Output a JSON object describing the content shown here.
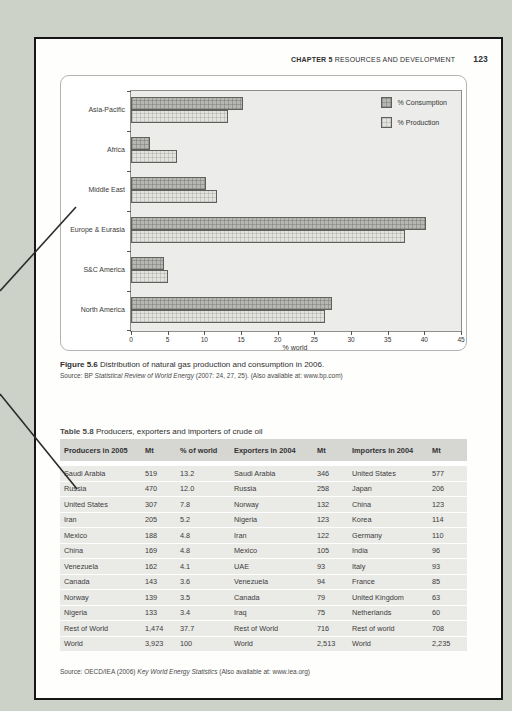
{
  "header": {
    "chapter_label": "CHAPTER 5",
    "chapter_title": "RESOURCES AND DEVELOPMENT",
    "page_number": "123"
  },
  "figure": {
    "caption_label": "Figure 5.6",
    "caption_text": " Distribution of natural gas production and consumption in 2006.",
    "source_prefix": "Source: BP ",
    "source_italic": "Statistical Review of World Energy",
    "source_suffix": " (2007: 24, 27, 25). (Also available at: www.bp.com)"
  },
  "chart_data": {
    "type": "bar",
    "orientation": "horizontal",
    "categories": [
      "Asia-Pacific",
      "Africa",
      "Middle East",
      "Europe & Eurasia",
      "S&C America",
      "North America"
    ],
    "series": [
      {
        "name": "% Consumption",
        "values": [
          15.3,
          2.6,
          10.2,
          40.2,
          4.5,
          27.4
        ],
        "color": "#b6b6b3"
      },
      {
        "name": "% Production",
        "values": [
          13.2,
          6.3,
          11.7,
          37.4,
          5.0,
          26.5
        ],
        "color": "#e2e2de"
      }
    ],
    "xlabel": "% world",
    "xlim": [
      0,
      45
    ],
    "xticks": [
      0,
      5,
      10,
      15,
      20,
      25,
      30,
      35,
      40,
      45
    ],
    "grid": false,
    "legend_position": "top-right",
    "plot_bg": "#ececea"
  },
  "table": {
    "title_label": "Table 5.8",
    "title_text": " Producers, exporters and importers of crude oil",
    "columns": [
      "Producers in 2005",
      "Mt",
      "% of world",
      "Exporters in 2004",
      "Mt",
      "Importers in 2004",
      "Mt"
    ],
    "rows": [
      [
        "Saudi Arabia",
        "519",
        "13.2",
        "Saudi Arabia",
        "346",
        "United States",
        "577"
      ],
      [
        "Russia",
        "470",
        "12.0",
        "Russia",
        "258",
        "Japan",
        "206"
      ],
      [
        "United States",
        "307",
        "7.8",
        "Norway",
        "132",
        "China",
        "123"
      ],
      [
        "Iran",
        "205",
        "5.2",
        "Nigeria",
        "123",
        "Korea",
        "114"
      ],
      [
        "Mexico",
        "188",
        "4.8",
        "Iran",
        "122",
        "Germany",
        "110"
      ],
      [
        "China",
        "169",
        "4.8",
        "Mexico",
        "105",
        "India",
        "96"
      ],
      [
        "Venezuela",
        "162",
        "4.1",
        "UAE",
        "93",
        "Italy",
        "93"
      ],
      [
        "Canada",
        "143",
        "3.6",
        "Venezuela",
        "94",
        "France",
        "85"
      ],
      [
        "Norway",
        "139",
        "3.5",
        "Canada",
        "79",
        "United Kingdom",
        "63"
      ],
      [
        "Nigeria",
        "133",
        "3.4",
        "Iraq",
        "75",
        "Netherlands",
        "60"
      ],
      [
        "Rest of World",
        "1,474",
        "37.7",
        "Rest of World",
        "716",
        "Rest of world",
        "708"
      ],
      [
        "World",
        "3,923",
        "100",
        "World",
        "2,513",
        "World",
        "2,235"
      ]
    ],
    "source_prefix": "Source: OECD/IEA (2006) ",
    "source_italic": "Key World Energy Statistics",
    "source_suffix": " (Also available at: www.iea.org)"
  },
  "colors": {
    "canvas_bg": "#cdd2c9",
    "page_border": "#161616",
    "annotation_line": "#2b2b2b"
  }
}
